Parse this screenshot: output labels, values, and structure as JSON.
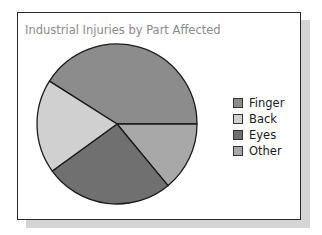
{
  "chart_data": {
    "type": "pie",
    "title": "Industrial Injuries by Part Affected",
    "categories": [
      "Finger",
      "Back",
      "Eyes",
      "Other"
    ],
    "values": [
      41,
      19,
      26,
      14
    ],
    "unit": "percent (estimated from slice angles)",
    "colors": [
      "#8c8c8c",
      "#d0d0d0",
      "#707070",
      "#a8a8a8"
    ],
    "legend_position": "right",
    "start_angle_note": "Finger begins at ~212° clockwise from east; slices proceed clockwise Finger→Other→Eyes→Back"
  },
  "legend": {
    "items": [
      {
        "label": "Finger",
        "color": "#8c8c8c"
      },
      {
        "label": "Back",
        "color": "#d0d0d0"
      },
      {
        "label": "Eyes",
        "color": "#707070"
      },
      {
        "label": "Other",
        "color": "#a8a8a8"
      }
    ]
  }
}
